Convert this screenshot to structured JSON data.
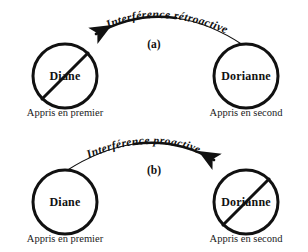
{
  "figure": {
    "background_color": "#ffffff",
    "ink_color": "#111111"
  },
  "panels": [
    {
      "tag": "(a)",
      "arc_label": "Interférence rétroactive",
      "arrow_direction": "right-to-left",
      "left_node": {
        "name": "Diane",
        "crossed_out": true,
        "caption": "Appris en premier"
      },
      "right_node": {
        "name": "Dorianne",
        "crossed_out": false,
        "caption": "Appris en second"
      }
    },
    {
      "tag": "(b)",
      "arc_label": "Interférence proactive",
      "arrow_direction": "left-to-right",
      "left_node": {
        "name": "Diane",
        "crossed_out": false,
        "caption": "Appris en premier"
      },
      "right_node": {
        "name": "Dorianne",
        "crossed_out": true,
        "caption": "Appris en second"
      }
    }
  ]
}
